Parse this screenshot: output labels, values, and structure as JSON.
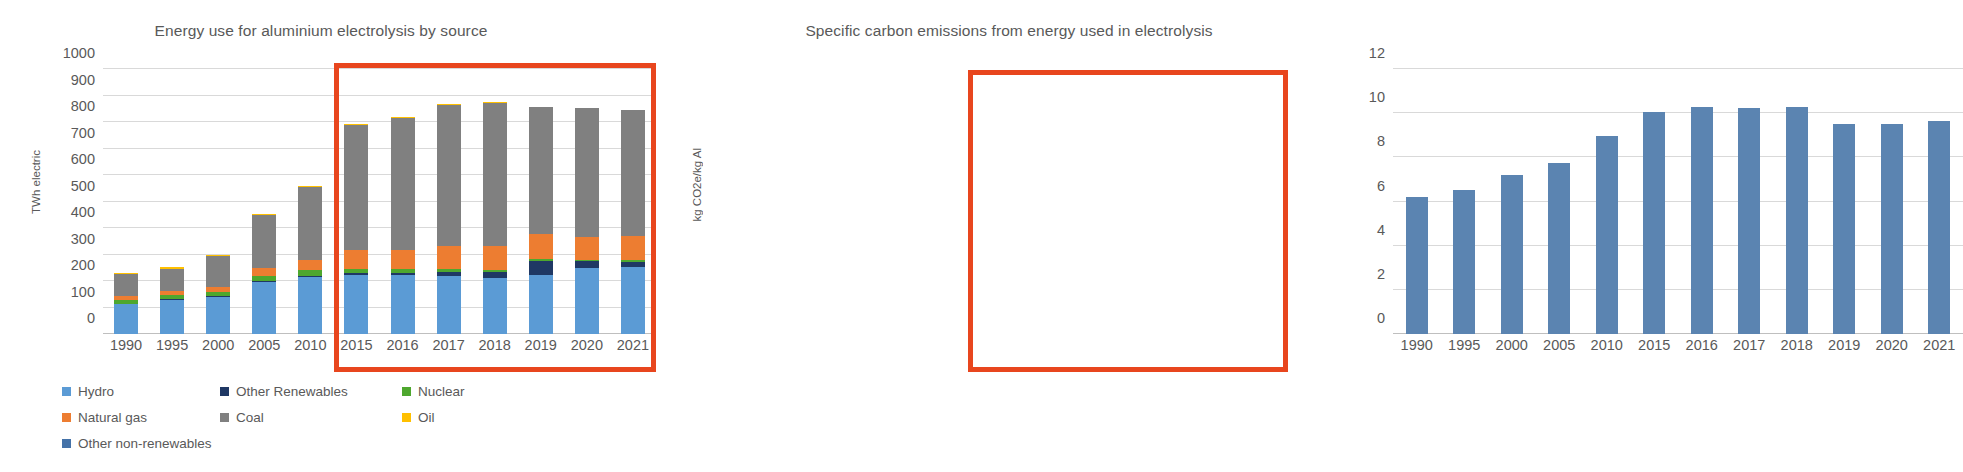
{
  "charts": {
    "left": {
      "title": "Energy use for aluminium electrolysis by source",
      "ylabel": "TWh electric"
    },
    "right": {
      "title": "Specific carbon emissions from energy used in electrolysis",
      "ylabel": "kg CO2e/kg Al"
    }
  },
  "legend": {
    "rows": [
      [
        {
          "label": "Hydro",
          "color": "#5b9bd5"
        },
        {
          "label": "Other Renewables",
          "color": "#1f3864"
        },
        {
          "label": "Nuclear",
          "color": "#4ea72e"
        }
      ],
      [
        {
          "label": "Natural gas",
          "color": "#ed7d31"
        },
        {
          "label": "Coal",
          "color": "#808080"
        },
        {
          "label": "Oil",
          "color": "#ffc000"
        }
      ],
      [
        {
          "label": "Other non-renewables",
          "color": "#4472a8"
        }
      ]
    ]
  },
  "highlight": {
    "color": "#e8461e",
    "note": "2015-2021 highlighted"
  },
  "chart_data": [
    {
      "type": "bar",
      "stacked": true,
      "title": "Energy use for aluminium electrolysis by source",
      "xlabel": "",
      "ylabel": "TWh electric",
      "ylim": [
        0,
        1000
      ],
      "yticks": [
        0,
        100,
        200,
        300,
        400,
        500,
        600,
        700,
        800,
        900,
        1000
      ],
      "grid": true,
      "legend_position": "bottom-left",
      "categories": [
        "1990",
        "1995",
        "2000",
        "2005",
        "2010",
        "2015",
        "2016",
        "2017",
        "2018",
        "2019",
        "2020",
        "2021"
      ],
      "series": [
        {
          "name": "Hydro",
          "color": "#5b9bd5",
          "values": [
            113,
            130,
            140,
            196,
            215,
            224,
            224,
            218,
            213,
            224,
            249,
            252
          ]
        },
        {
          "name": "Other Renewables",
          "color": "#1f3864",
          "values": [
            2,
            2,
            3,
            4,
            5,
            5,
            6,
            17,
            20,
            52,
            25,
            20
          ]
        },
        {
          "name": "Nuclear",
          "color": "#4ea72e",
          "values": [
            14,
            16,
            17,
            20,
            21,
            17,
            14,
            10,
            9,
            7,
            6,
            6
          ]
        },
        {
          "name": "Natural gas",
          "color": "#ed7d31",
          "values": [
            14,
            16,
            19,
            31,
            39,
            70,
            72,
            86,
            90,
            96,
            87,
            93
          ]
        },
        {
          "name": "Coal",
          "color": "#808080",
          "values": [
            82,
            83,
            117,
            197,
            274,
            473,
            501,
            533,
            540,
            478,
            486,
            473
          ]
        },
        {
          "name": "Oil",
          "color": "#ffc000",
          "values": [
            5,
            5,
            4,
            4,
            4,
            3,
            3,
            4,
            2,
            1,
            1,
            1
          ]
        },
        {
          "name": "Other non-renewables",
          "color": "#4472a8",
          "values": [
            0,
            0,
            0,
            0,
            0,
            0,
            0,
            0,
            0,
            0,
            0,
            0
          ]
        }
      ],
      "totals": [
        230,
        252,
        300,
        452,
        558,
        792,
        820,
        868,
        874,
        858,
        854,
        845
      ],
      "highlight_categories": [
        "2015",
        "2016",
        "2017",
        "2018",
        "2019",
        "2020",
        "2021"
      ]
    },
    {
      "type": "bar",
      "stacked": false,
      "title": "Specific carbon emissions from energy used in electrolysis",
      "xlabel": "",
      "ylabel": "kg CO2e/kg Al",
      "ylim": [
        0,
        12
      ],
      "yticks": [
        0,
        2,
        4,
        6,
        8,
        10,
        12
      ],
      "grid": true,
      "categories": [
        "1990",
        "1995",
        "2000",
        "2005",
        "2010",
        "2015",
        "2016",
        "2017",
        "2018",
        "2019",
        "2020",
        "2021"
      ],
      "values": [
        6.2,
        6.5,
        7.2,
        7.75,
        8.95,
        10.05,
        10.3,
        10.25,
        10.3,
        9.5,
        9.5,
        9.65
      ],
      "bar_color": "#5b84b1",
      "highlight_categories": [
        "2015",
        "2016",
        "2017",
        "2018",
        "2019",
        "2020",
        "2021"
      ]
    }
  ]
}
